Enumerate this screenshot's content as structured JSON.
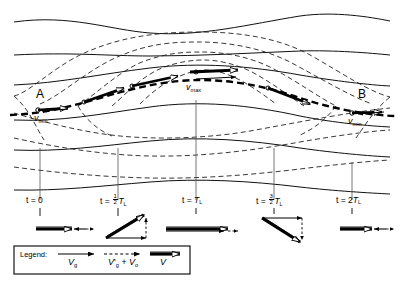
{
  "figure": {
    "colors": {
      "ink": "#000000",
      "streamline": "#1a1a1a",
      "contour_dashed": "#2b2b2b",
      "background": "#ffffff"
    }
  },
  "annotations": {
    "point_a": "A",
    "point_b": "B",
    "v_max_letter": "v",
    "v_max_sub": "max",
    "v_min_left_letter": "v",
    "v_min_left_sub": "min",
    "v_min_right_letter": "v",
    "v_min_right_sub": "min"
  },
  "time_axis": {
    "ticks": [
      {
        "id": "t0",
        "prefix": "t = 0",
        "frac_num": "",
        "frac_den": "",
        "suffix": "",
        "sub": "",
        "x": 40
      },
      {
        "id": "t-half",
        "prefix": "t = ",
        "frac_num": "1",
        "frac_den": "2",
        "suffix": "T",
        "sub": "L",
        "x": 118
      },
      {
        "id": "t-one",
        "prefix": "t = ",
        "frac_num": "",
        "frac_den": "",
        "suffix": "T",
        "sub": "L",
        "x": 196
      },
      {
        "id": "t-threehalf",
        "prefix": "t = ",
        "frac_num": "3",
        "frac_den": "2",
        "suffix": "T",
        "sub": "L",
        "x": 274
      },
      {
        "id": "t-two",
        "prefix": "t = 2",
        "frac_num": "",
        "frac_den": "",
        "suffix": "T",
        "sub": "L",
        "x": 352
      }
    ]
  },
  "vector_panels": [
    {
      "id": "panel-t0",
      "description": "horizontal double arrow right with short dashed arrow left"
    },
    {
      "id": "panel-t-half",
      "description": "up-right slanted double arrow with dashed vertical drop"
    },
    {
      "id": "panel-t-one",
      "description": "long horizontal double arrow right with dashed arrow"
    },
    {
      "id": "panel-t-threehalf",
      "description": "down-right slanted double arrow with dashed vertical"
    },
    {
      "id": "panel-t-two",
      "description": "horizontal double arrow right with short dashed arrow left"
    }
  ],
  "legend": {
    "title": "Legend:",
    "entries": [
      {
        "id": "legend-vg",
        "style": "solid-single-arrow",
        "letter": "V",
        "sub": "g",
        "prime": "",
        "extra": ""
      },
      {
        "id": "legend-vg-plus-vo",
        "style": "dashed-single-arrow",
        "letter": "V",
        "sub": "g",
        "prime": "'",
        "extra": " + V",
        "extra_sub": "o"
      },
      {
        "id": "legend-v",
        "style": "hollow-double-arrow",
        "letter": "V",
        "sub": "",
        "prime": "",
        "extra": ""
      }
    ]
  }
}
